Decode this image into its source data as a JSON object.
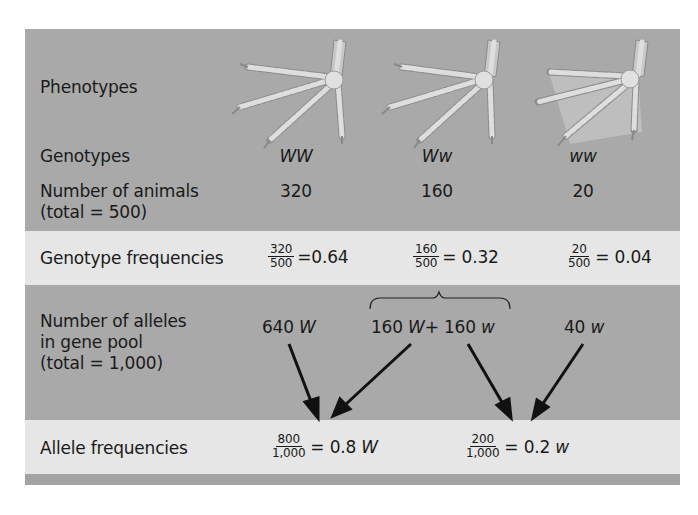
{
  "figure": {
    "rows": {
      "phenotypes": {
        "label": "Phenotypes"
      },
      "genotypes": {
        "label": "Genotypes",
        "values": [
          "WW",
          "Ww",
          "ww"
        ]
      },
      "number_of_animals": {
        "label_line1": "Number of animals",
        "label_line2": "(total = 500)",
        "values": [
          "320",
          "160",
          "20"
        ]
      },
      "genotype_frequencies": {
        "label": "Genotype frequencies",
        "items": [
          {
            "numerator": "320",
            "denominator": "500",
            "equals": "=",
            "result": "0.64"
          },
          {
            "numerator": "160",
            "denominator": "500",
            "equals": "=",
            "result": "0.32"
          },
          {
            "numerator": "20",
            "denominator": "500",
            "equals": "=",
            "result": "0.04"
          }
        ]
      },
      "number_of_alleles": {
        "label_line1": "Number of alleles",
        "label_line2": "in gene pool",
        "label_line3": "(total = 1,000)",
        "col1": {
          "count": "640",
          "allele": "W"
        },
        "col2": {
          "count_a": "160",
          "allele_a": "W",
          "plus": "+",
          "count_b": "160",
          "allele_b": "w"
        },
        "col3": {
          "count": "40",
          "allele": "w"
        }
      },
      "allele_frequencies": {
        "label": "Allele frequencies",
        "items": [
          {
            "numerator": "800",
            "denominator": "1,000",
            "equals": "=",
            "result": "0.8",
            "allele": "W"
          },
          {
            "numerator": "200",
            "denominator": "1,000",
            "equals": "=",
            "result": "0.2",
            "allele": "w"
          }
        ]
      }
    },
    "colors": {
      "dark_band": "#a9a9a9",
      "light_band": "#e6e6e6",
      "arrow": "#111111",
      "foot": "#d4d4d4"
    },
    "phenotype_icons": [
      "chicken-foot-icon",
      "chicken-foot-icon",
      "webbed-foot-icon"
    ]
  }
}
